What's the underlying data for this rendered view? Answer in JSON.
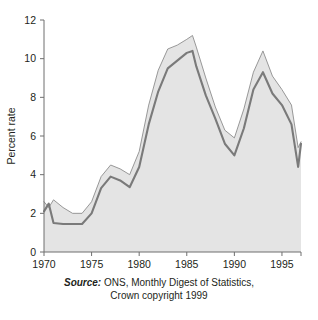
{
  "figure": {
    "caption_source_word": "Source:",
    "caption_line1": " ONS, Monthly Digest of Statistics,",
    "caption_line2": "Crown copyright 1999"
  },
  "colors": {
    "band_fill": "#e4e4e4",
    "band_outline": "#8d8d8d",
    "series_line": "#7a7a7a",
    "axis": "#6f6f6f",
    "text": "#231f20",
    "background": "#ffffff"
  },
  "chart_data": {
    "type": "line",
    "title": "",
    "xlabel": "",
    "ylabel": "Percent rate",
    "xlim": [
      1970,
      1997
    ],
    "ylim": [
      0,
      12
    ],
    "ytick_labels": [
      "0",
      "2",
      "4",
      "6",
      "8",
      "10",
      "12"
    ],
    "yticks": [
      0,
      2,
      4,
      6,
      8,
      10,
      12
    ],
    "xtick_labels": [
      "1970",
      "1975",
      "1980",
      "1985",
      "1990",
      "1995"
    ],
    "xticks": [
      1970,
      1975,
      1980,
      1985,
      1990,
      1995
    ],
    "grid": false,
    "legend": "none",
    "x": [
      1970,
      1970.5,
      1971,
      1972,
      1973,
      1974,
      1975,
      1976,
      1977,
      1978,
      1979,
      1980,
      1981,
      1982,
      1983,
      1984,
      1985,
      1985.6,
      1986,
      1987,
      1988,
      1989,
      1990,
      1991,
      1992,
      1993,
      1994,
      1995,
      1996,
      1996.7,
      1997
    ],
    "series": [
      {
        "name": "Upper band (claimant-count upper estimate)",
        "values": [
          2.6,
          2.3,
          2.7,
          2.3,
          2.0,
          2.0,
          2.6,
          3.9,
          4.5,
          4.3,
          4.0,
          5.2,
          7.6,
          9.4,
          10.5,
          10.7,
          11.0,
          11.2,
          10.6,
          9.0,
          7.5,
          6.3,
          5.9,
          7.4,
          9.3,
          10.4,
          9.1,
          8.4,
          7.6,
          5.4,
          5.7
        ]
      },
      {
        "name": "Percent rate (central line)",
        "values": [
          2.1,
          2.5,
          1.5,
          1.45,
          1.45,
          1.45,
          2.0,
          3.3,
          3.9,
          3.7,
          3.35,
          4.4,
          6.6,
          8.3,
          9.5,
          9.9,
          10.3,
          10.4,
          9.6,
          8.1,
          6.9,
          5.6,
          5.0,
          6.4,
          8.4,
          9.3,
          8.2,
          7.6,
          6.6,
          4.4,
          5.6
        ]
      },
      {
        "name": "Lower band (claimant-count lower estimate)",
        "values": [
          1.7,
          1.7,
          1.3,
          1.3,
          1.3,
          1.3,
          1.6,
          2.9,
          3.5,
          3.3,
          3.0,
          4.0,
          6.1,
          7.9,
          9.1,
          9.6,
          10.0,
          10.1,
          9.2,
          7.6,
          6.4,
          5.2,
          4.7,
          6.0,
          8.0,
          9.0,
          7.9,
          7.3,
          6.3,
          4.3,
          5.4
        ]
      }
    ],
    "annotations": []
  }
}
